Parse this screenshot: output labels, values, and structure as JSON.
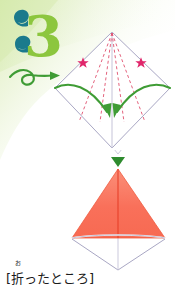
{
  "page": {
    "width": 175,
    "height": 300,
    "background_color": "#ffffff",
    "wash_color": "#dff0c0"
  },
  "step": {
    "number": "3",
    "number_color_front": "#8cc63e",
    "number_color_back": "#1a7a8c"
  },
  "flip_arrow": {
    "name": "flip-over-loop-arrow",
    "color": "#3f9c35",
    "direction": "right"
  },
  "figure_top": {
    "name": "origami-diamond-with-fold-guides",
    "outline_color": "#a9a7c4",
    "dashed_fold_color": "#e0506e",
    "fold_arrow_color": "#3f9c35",
    "star_color": "#e0266b",
    "stars": [
      {
        "label": "left-star",
        "x": 31,
        "y": 37
      },
      {
        "label": "right-star",
        "x": 89,
        "y": 37
      }
    ],
    "dashed_lines": 4,
    "arrows": 2
  },
  "figure_bottom": {
    "name": "folded-result-kite",
    "fill_color": "#f9705a",
    "fill_highlight": "#fb8f79",
    "outline_color": "#a9a7c4",
    "crease_color": "#e8402a",
    "marker_color": "#2e8b2e",
    "marker_name": "down-triangle-marker"
  },
  "caption": {
    "open_bracket": "[",
    "ruby": "お",
    "base": "折",
    "rest": "ったところ",
    "close_bracket": "]",
    "full_text": "[折ったところ]"
  }
}
